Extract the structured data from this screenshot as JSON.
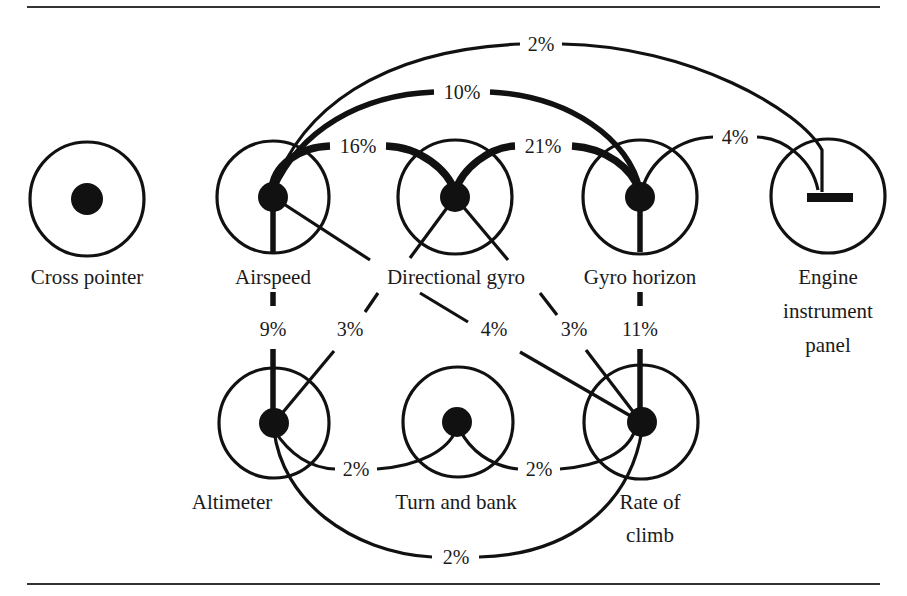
{
  "diagram": {
    "type": "instrument-scan-link-diagram",
    "instruments": [
      {
        "id": "cross_pointer",
        "label": "Cross pointer",
        "cx": 87,
        "cy": 199
      },
      {
        "id": "airspeed",
        "label": "Airspeed",
        "cx": 273,
        "cy": 197
      },
      {
        "id": "directional_gyro",
        "label": "Directional gyro",
        "cx": 455,
        "cy": 197
      },
      {
        "id": "gyro_horizon",
        "label": "Gyro horizon",
        "cx": 640,
        "cy": 197
      },
      {
        "id": "engine_panel",
        "label_lines": [
          "Engine",
          "instrument",
          "panel"
        ],
        "cx": 828,
        "cy": 196
      },
      {
        "id": "altimeter",
        "label": "Altimeter",
        "cx": 274,
        "cy": 423
      },
      {
        "id": "turn_and_bank",
        "label": "Turn and bank",
        "cx": 458,
        "cy": 422
      },
      {
        "id": "rate_of_climb",
        "label_lines": [
          "Rate of",
          "climb"
        ],
        "cx": 641,
        "cy": 422
      }
    ],
    "links": [
      {
        "from": "airspeed",
        "to": "engine_panel",
        "value": "2%"
      },
      {
        "from": "airspeed",
        "to": "gyro_horizon",
        "value": "10%"
      },
      {
        "from": "airspeed",
        "to": "directional_gyro",
        "value": "16%"
      },
      {
        "from": "directional_gyro",
        "to": "gyro_horizon",
        "value": "21%"
      },
      {
        "from": "gyro_horizon",
        "to": "engine_panel",
        "value": "4%"
      },
      {
        "from": "airspeed",
        "to": "altimeter",
        "value": "9%"
      },
      {
        "from": "directional_gyro",
        "to": "altimeter",
        "value": "3%"
      },
      {
        "from": "airspeed",
        "to": "rate_of_climb",
        "value": "4%"
      },
      {
        "from": "directional_gyro",
        "to": "rate_of_climb",
        "value": "3%"
      },
      {
        "from": "gyro_horizon",
        "to": "rate_of_climb",
        "value": "11%"
      },
      {
        "from": "altimeter",
        "to": "turn_and_bank",
        "value": "2%"
      },
      {
        "from": "turn_and_bank",
        "to": "rate_of_climb",
        "value": "2%"
      },
      {
        "from": "altimeter",
        "to": "rate_of_climb",
        "value": "2%"
      }
    ]
  }
}
